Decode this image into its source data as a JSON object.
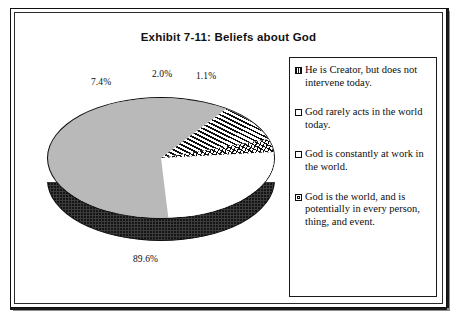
{
  "figure": {
    "title": "Exhibit 7-11: Beliefs about God",
    "frame_color": "#1a1a1a",
    "background": "#ffffff"
  },
  "chart_data": {
    "type": "pie",
    "title": "Exhibit 7-11: Beliefs about God",
    "xlabel": "",
    "ylabel": "",
    "three_d": true,
    "legend_position": "right",
    "grid": false,
    "categories": [
      "He is Creator, but does not intervene today.",
      "God rarely acts in the world today.",
      "God is constantly at work in the world.",
      "God is the world, and is potentially in every person, thing, and event."
    ],
    "values": [
      7.4,
      2.0,
      1.1,
      89.6
    ],
    "value_labels": [
      "7.4%",
      "2.0%",
      "1.1%",
      "89.6%"
    ],
    "unit": "%",
    "slice_patterns": [
      "vertical-stripes",
      "crosshatch",
      "solid-white",
      "light-gray-dotted"
    ],
    "slice_colors": [
      "#ffffff",
      "#ffffff",
      "#ffffff",
      "#b9b9b9"
    ],
    "side_wall_color": "#3c3c3c"
  },
  "labels": {
    "vertical": "7.4%",
    "cross": "2.0%",
    "white": "1.1%",
    "gray": "89.6%"
  },
  "legend": {
    "items": [
      {
        "marker": "vertical-stripes-swatch",
        "label": "He is Creator, but does not intervene today."
      },
      {
        "marker": "empty-square-swatch",
        "label": "God rarely acts in the world today."
      },
      {
        "marker": "empty-square-swatch",
        "label": "God is constantly at work in the world."
      },
      {
        "marker": "filled-center-square-swatch",
        "label": "God is the world, and is potentially in every person, thing, and event."
      }
    ]
  }
}
